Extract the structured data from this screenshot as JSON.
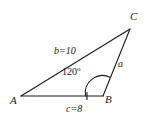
{
  "figure": {
    "type": "triangle-diagram",
    "background_color": "#ffffff",
    "stroke_color": "#1a1a1a",
    "vertices": {
      "A": {
        "label": "A",
        "x": 21,
        "y": 96
      },
      "B": {
        "label": "B",
        "x": 103,
        "y": 96
      },
      "C": {
        "label": "C",
        "x": 130,
        "y": 29
      }
    },
    "sides": {
      "a": {
        "label": "a",
        "from": "B",
        "to": "C",
        "value": ""
      },
      "b": {
        "label": "b=10",
        "from": "A",
        "to": "C",
        "value": "10"
      },
      "c": {
        "label": "c=8",
        "from": "A",
        "to": "B",
        "value": "8"
      }
    },
    "angle": {
      "at": "B",
      "value": "120",
      "degree_symbol": "o",
      "label": "120"
    },
    "tick_mark": {
      "on": "c",
      "count": 1
    }
  }
}
